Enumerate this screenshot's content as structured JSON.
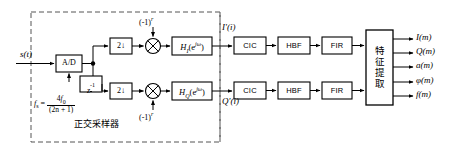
{
  "diagram": {
    "title_group_label": "正交采样器",
    "input_signal": "s(t)",
    "blocks": {
      "adc": "A/D",
      "delay": "z",
      "delay_exp": "-1",
      "down1": "2↓",
      "down2": "2↓",
      "mult_symbol": "⊗",
      "mult_ctrl_1": "(-1)",
      "mult_ctrl_1_exp": "r",
      "mult_ctrl_2": "(-1)",
      "mult_ctrl_2_exp": "r",
      "filter_i": "H",
      "filter_i_sub": "I",
      "filter_i_arg": "(e",
      "filter_i_exp": "jω",
      "filter_i_close": ")",
      "filter_q": "H",
      "filter_q_sub": "Q",
      "filter_q_arg": "(e",
      "filter_q_exp": "jω",
      "filter_q_close": ")",
      "cic_top": "CIC",
      "cic_bot": "CIC",
      "hbf_top": "HBF",
      "hbf_bot": "HBF",
      "fir_top": "FIR",
      "fir_bot": "FIR",
      "feature_extraction_chars": [
        "特",
        "征",
        "提",
        "取"
      ]
    },
    "sampling_rate": {
      "symbol": "f",
      "subscript": "s",
      "equals": "=",
      "numerator_coeff": "4",
      "numerator_f": "f",
      "numerator_sub": "0",
      "denominator": "(2n + 1)"
    },
    "intermediate_labels": {
      "i_path": "I'(i)",
      "q_path": "Q'(i)"
    },
    "outputs": [
      "I(m)",
      "Q(m)",
      "a(m)",
      "φ(m)",
      "f(m)"
    ]
  }
}
